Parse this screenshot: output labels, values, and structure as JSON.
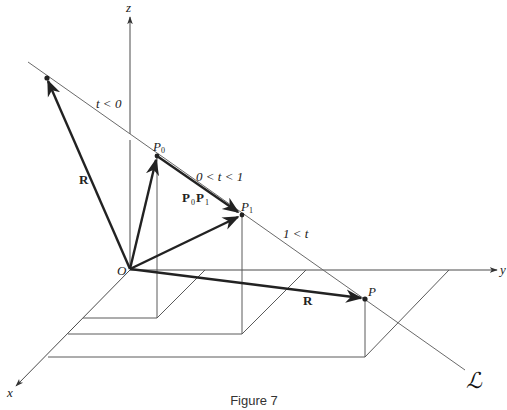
{
  "figure": {
    "caption": "Figure 7",
    "axes": {
      "x_label": "x",
      "y_label": "y",
      "z_label": "z"
    },
    "points": {
      "origin": "O",
      "p0": "P",
      "p0_sub": "0",
      "p1": "P",
      "p1_sub": "1",
      "p": "P"
    },
    "vectors": {
      "r_left": "R",
      "r_bottom": "R",
      "p0p1_a": "P",
      "p0p1_a_sub": "0",
      "p0p1_b": "P",
      "p0p1_b_sub": "1"
    },
    "intervals": {
      "before": "t < 0",
      "between": "0 < t < 1",
      "after": "1 < t"
    },
    "line_label": "ℒ",
    "colors": {
      "vector": "#222222",
      "line": "#6a6a6a",
      "axis": "#4a4a4a"
    }
  }
}
